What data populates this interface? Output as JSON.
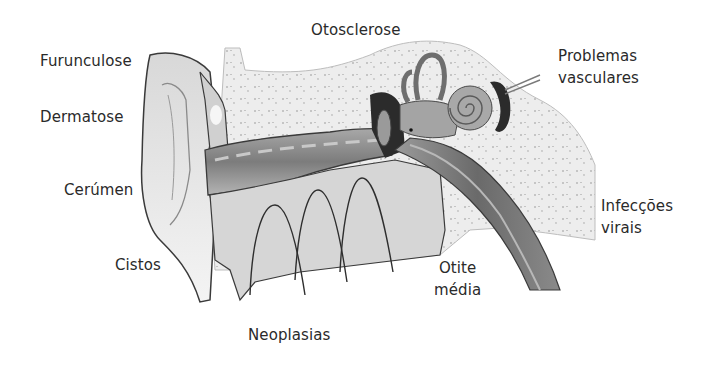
{
  "diagram": {
    "labels": {
      "furunculose": "Furunculose",
      "dermatose": "Dermatose",
      "cerumen": "Cerúmen",
      "cistos": "Cistos",
      "neoplasias": "Neoplasias",
      "otosclerose": "Otosclerose",
      "problemas_l1": "Problemas",
      "problemas_l2": "vasculares",
      "infeccoes_l1": "Infecções",
      "infeccoes_l2": "virais",
      "otite_l1": "Otite",
      "otite_l2": "média"
    },
    "colors": {
      "background": "#ffffff",
      "text": "#2a2a2a",
      "bone": "#ececec",
      "tissue": "#c8c8c8",
      "canal": "#8a8a8a",
      "dark": "#2b2b2b",
      "outline": "#3a3a3a"
    }
  }
}
